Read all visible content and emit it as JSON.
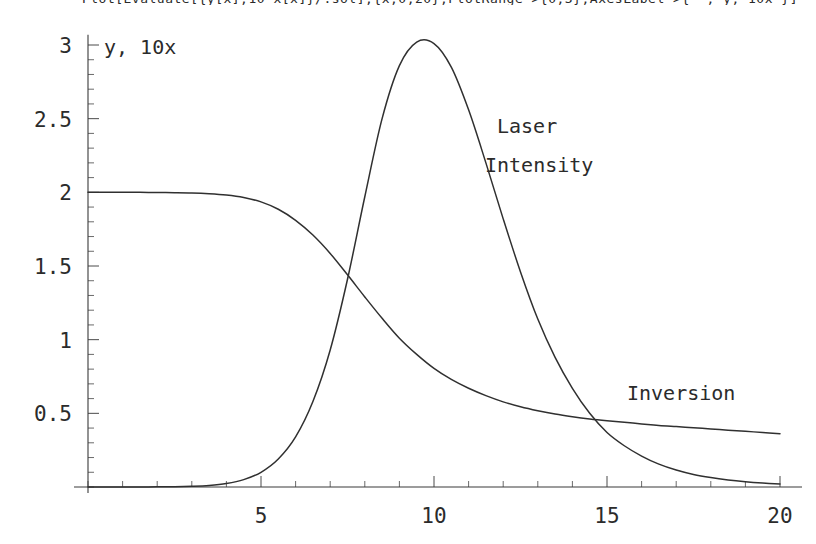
{
  "code_line": {
    "text": "Plot[Evaluate[{y[x],10 x[x]}/.sol],{x,0,20},PlotRange->{0,3},AxesLabel->{\"\",\"y, 10x\"}]"
  },
  "chart_data": {
    "type": "line",
    "title": "",
    "xlabel": "",
    "ylabel": "y, 10x",
    "xlim": [
      0,
      20
    ],
    "ylim": [
      0,
      3.05
    ],
    "grid": false,
    "legend_position": "inline-annotations",
    "x_ticks": [
      5,
      10,
      15,
      20
    ],
    "x_tick_labels": [
      "5",
      "10",
      "15",
      "20"
    ],
    "x_minor_tick_step": 1,
    "y_ticks": [
      0.5,
      1,
      1.5,
      2,
      2.5,
      3
    ],
    "y_tick_labels": [
      "0.5",
      "1",
      "1.5",
      "2",
      "2.5",
      "3"
    ],
    "y_minor_tick_step": 0.1,
    "series": [
      {
        "name": "Inversion",
        "label_x": 16.6,
        "label_y": 0.56,
        "x": [
          0,
          0.5,
          1,
          1.5,
          2,
          2.5,
          3,
          3.5,
          4,
          4.5,
          5,
          5.5,
          6,
          6.5,
          7,
          7.5,
          8,
          8.5,
          9,
          9.5,
          10,
          10.5,
          11,
          11.5,
          12,
          12.5,
          13,
          13.5,
          14,
          14.5,
          15,
          15.5,
          16,
          16.5,
          17,
          17.5,
          18,
          18.5,
          19,
          19.5,
          20
        ],
        "values": [
          2.0,
          2.0,
          2.0,
          2.0,
          1.999,
          1.998,
          1.996,
          1.991,
          1.982,
          1.965,
          1.935,
          1.885,
          1.81,
          1.71,
          1.585,
          1.44,
          1.29,
          1.145,
          1.01,
          0.9,
          0.805,
          0.73,
          0.67,
          0.62,
          0.578,
          0.545,
          0.518,
          0.495,
          0.477,
          0.462,
          0.45,
          0.44,
          0.428,
          0.418,
          0.41,
          0.402,
          0.394,
          0.386,
          0.378,
          0.37,
          0.362
        ]
      },
      {
        "name": "Laser Intensity",
        "label_x": 11.8,
        "label_y": 2.42,
        "x": [
          0,
          0.5,
          1,
          1.5,
          2,
          2.5,
          3,
          3.5,
          4,
          4.5,
          5,
          5.5,
          6,
          6.5,
          7,
          7.5,
          8,
          8.5,
          9,
          9.5,
          10,
          10.5,
          11,
          11.5,
          12,
          12.5,
          13,
          13.5,
          14,
          14.5,
          15,
          15.5,
          16,
          16.5,
          17,
          17.5,
          18,
          18.5,
          19,
          19.5,
          20
        ],
        "values": [
          0.0,
          0.0,
          0.0,
          0.0,
          0.001,
          0.002,
          0.005,
          0.011,
          0.024,
          0.05,
          0.1,
          0.19,
          0.34,
          0.58,
          0.93,
          1.41,
          1.97,
          2.5,
          2.86,
          3.02,
          3.01,
          2.85,
          2.56,
          2.2,
          1.82,
          1.46,
          1.14,
          0.88,
          0.67,
          0.5,
          0.37,
          0.28,
          0.21,
          0.155,
          0.115,
          0.085,
          0.064,
          0.048,
          0.036,
          0.027,
          0.02
        ]
      }
    ],
    "annotations": [
      {
        "name": "laser-intensity-label",
        "lines": [
          "Laser",
          "Intensity"
        ]
      },
      {
        "name": "inversion-label",
        "lines": [
          "Inversion"
        ]
      }
    ]
  }
}
